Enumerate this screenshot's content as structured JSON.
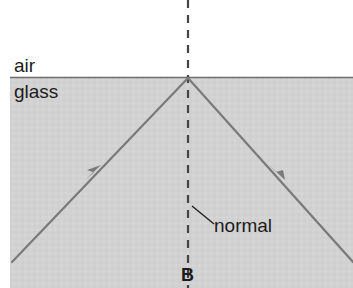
{
  "figure": {
    "width": 353,
    "height": 288,
    "background_color": "#ffffff"
  },
  "media": {
    "upper_label": "air",
    "lower_label": "glass",
    "glass_fill_color": "#d2d2d2",
    "interface_line_color": "#6e6e6e",
    "interface_y": 77,
    "glass_left_edge_x": 10
  },
  "normal_line": {
    "label": "normal",
    "x": 188,
    "top_y": 0,
    "bottom_y": 288,
    "style": "dashed",
    "color": "#444444",
    "leader_from": {
      "x": 192,
      "y": 206
    },
    "leader_to": {
      "x": 213,
      "y": 224
    }
  },
  "point": {
    "label": "B",
    "x": 188,
    "y": 78
  },
  "rays": [
    {
      "name": "incident-ray",
      "from": {
        "x": 12,
        "y": 262
      },
      "to": {
        "x": 188,
        "y": 78
      },
      "color": "#7a7a7a",
      "arrow_at": {
        "x": 95,
        "y": 172
      },
      "arrow_direction": "up-right"
    },
    {
      "name": "reflected-ray",
      "from": {
        "x": 188,
        "y": 78
      },
      "to": {
        "x": 353,
        "y": 262
      },
      "color": "#7a7a7a",
      "arrow_at": {
        "x": 278,
        "y": 172
      },
      "arrow_direction": "down-right"
    }
  ]
}
